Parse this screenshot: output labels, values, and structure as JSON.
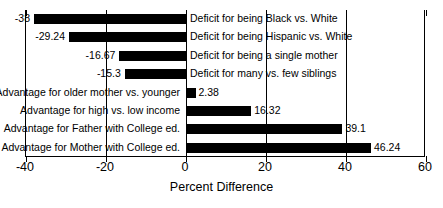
{
  "chart_data": {
    "type": "bar",
    "orientation": "horizontal",
    "title": "",
    "subtitle": "",
    "xlabel": "Percent Difference",
    "ylabel": "",
    "xlim": [
      -40,
      60
    ],
    "ylim": null,
    "grid": true,
    "gridlines_x": [
      -40,
      -20,
      0,
      20,
      40,
      60
    ],
    "xticks": [
      -40,
      -20,
      0,
      20,
      40,
      60
    ],
    "xtick_labels": [
      "-40",
      "-20",
      "0",
      "20",
      "40",
      "60"
    ],
    "legend": null,
    "legend_position": "none",
    "bar_color": "#000000",
    "background_color": "#ffffff",
    "categories": [
      "Deficit for being Black vs. White",
      "Deficit for being Hispanic vs. White",
      "Deficit for being a single mother",
      "Deficit for many vs. few siblings",
      "Advantage for older mother vs. younger",
      "Advantage for high vs. low income",
      "Advantage for Father with College ed.",
      "Advantage for Mother with College ed."
    ],
    "values": [
      -38,
      -29.24,
      -16.67,
      -15.3,
      2.38,
      16.32,
      39.1,
      46.24
    ],
    "data_labels": [
      "-38",
      "-29.24",
      "-16.67",
      "-15.3",
      "2.38",
      "16.32",
      "39.1",
      "46.24"
    ],
    "bars": [
      {
        "label": "Deficit for being Black vs. White",
        "value": -38,
        "value_text": "-38"
      },
      {
        "label": "Deficit for being Hispanic vs. White",
        "value": -29.24,
        "value_text": "-29.24"
      },
      {
        "label": "Deficit for being a single mother",
        "value": -16.67,
        "value_text": "-16.67"
      },
      {
        "label": "Deficit for many vs. few siblings",
        "value": -15.3,
        "value_text": "-15.3"
      },
      {
        "label": "Advantage for older mother vs. younger",
        "value": 2.38,
        "value_text": "2.38"
      },
      {
        "label": "Advantage for high vs. low income",
        "value": 16.32,
        "value_text": "16.32"
      },
      {
        "label": "Advantage for Father with College ed.",
        "value": 39.1,
        "value_text": "39.1"
      },
      {
        "label": "Advantage for Mother with College ed.",
        "value": 46.24,
        "value_text": "46.24"
      }
    ]
  }
}
